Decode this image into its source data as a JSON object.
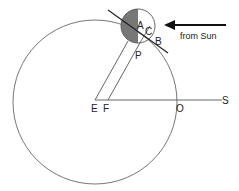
{
  "diagram": {
    "labels": {
      "A": "A",
      "B": "B",
      "C": "C",
      "P": "P",
      "E": "E",
      "F": "F",
      "O": "O",
      "S": "S"
    },
    "arrow_caption": "from Sun",
    "colors": {
      "line": "#555555",
      "shadow": "#777777",
      "arrow": "#111111",
      "background": "#ffffff"
    }
  }
}
